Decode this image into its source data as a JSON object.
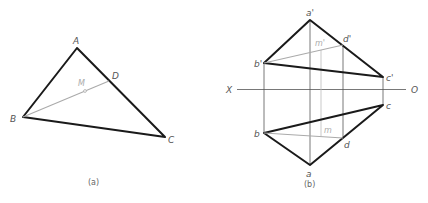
{
  "figure_a": {
    "caption": "(a)",
    "labels": {
      "A": "A",
      "B": "B",
      "C": "C",
      "D": "D",
      "M": "M"
    }
  },
  "figure_b": {
    "caption": "(b)",
    "axis": {
      "left": "X",
      "right": "O"
    },
    "labels": {
      "a_prime": "a'",
      "b_prime": "b'",
      "c_prime": "c'",
      "d_prime": "d'",
      "m_prime": "m'",
      "a": "a",
      "b": "b",
      "c": "c",
      "d": "d",
      "m": "m"
    }
  }
}
